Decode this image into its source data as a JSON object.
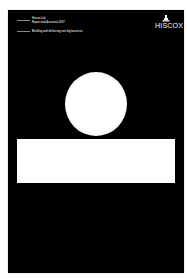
{
  "cover": {
    "background_color": "#000000",
    "header": {
      "line1": "Hiscox Ltd",
      "line2": "Report and Accounts 2007",
      "line3": "Building and delivering one big business"
    },
    "logo": {
      "icon": "castle-icon",
      "text": "HISCOX"
    },
    "shapes": {
      "circle_color": "#ffffff",
      "band_color": "#ffffff"
    }
  }
}
